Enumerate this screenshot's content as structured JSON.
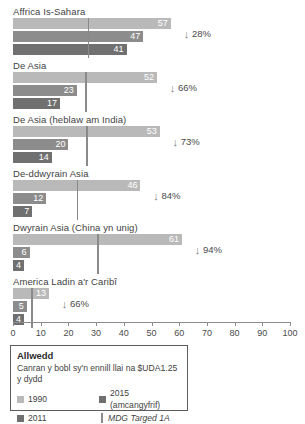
{
  "chart_data": {
    "type": "bar",
    "title": "",
    "xlabel": "",
    "ylabel": "",
    "xlim": [
      0,
      100
    ],
    "grid": false,
    "orientation": "horizontal",
    "legend_position": "bottom-left",
    "tick_labels": [
      "0",
      "10",
      "20",
      "30",
      "40",
      "50",
      "60",
      "70",
      "80",
      "90",
      "100"
    ],
    "ticks": [
      0,
      10,
      20,
      30,
      40,
      50,
      60,
      70,
      80,
      90,
      100
    ],
    "series": [
      {
        "name": "1990",
        "color": "#b9b9b9",
        "values": [
          57,
          52,
          53,
          46,
          61,
          13
        ]
      },
      {
        "name": "2015 (amcangyfrif)",
        "color": "#8c8c8c",
        "values": [
          47,
          23,
          20,
          12,
          6,
          5
        ]
      },
      {
        "name": "2011",
        "color": "#707070",
        "values": [
          41,
          17,
          14,
          7,
          4,
          4
        ]
      }
    ],
    "categories": [
      "Affrica Is-Sahara",
      "De Asia",
      "De Asia (heblaw am India)",
      "De-ddwyrain Asia",
      "Dwyrain Asia (China yn unig)",
      "America Ladin a'r Caribî"
    ],
    "target_values": [
      27,
      26,
      26.5,
      23,
      30.5,
      6.5
    ],
    "annotations": [
      "28%",
      "66%",
      "73%",
      "84%",
      "94%",
      "66%"
    ]
  },
  "groups": [
    {
      "label": "Affrica Is-Sahara",
      "bars": [
        {
          "series": "1990",
          "value": 57,
          "label": "57",
          "class": "y1990"
        },
        {
          "series": "2015",
          "value": 47,
          "label": "47",
          "class": "y2015"
        },
        {
          "series": "2011",
          "value": 41,
          "label": "41",
          "class": "y2011"
        }
      ],
      "target": 27,
      "delta": "28%"
    },
    {
      "label": "De Asia",
      "bars": [
        {
          "series": "1990",
          "value": 52,
          "label": "52",
          "class": "y1990"
        },
        {
          "series": "2015",
          "value": 23,
          "label": "23",
          "class": "y2015"
        },
        {
          "series": "2011",
          "value": 17,
          "label": "17",
          "class": "y2011"
        }
      ],
      "target": 26,
      "delta": "66%"
    },
    {
      "label": "De Asia (heblaw am India)",
      "bars": [
        {
          "series": "1990",
          "value": 53,
          "label": "53",
          "class": "y1990"
        },
        {
          "series": "2015",
          "value": 20,
          "label": "20",
          "class": "y2015"
        },
        {
          "series": "2011",
          "value": 14,
          "label": "14",
          "class": "y2011"
        }
      ],
      "target": 26.5,
      "delta": "73%"
    },
    {
      "label": "De-ddwyrain Asia",
      "bars": [
        {
          "series": "1990",
          "value": 46,
          "label": "46",
          "class": "y1990"
        },
        {
          "series": "2015",
          "value": 12,
          "label": "12",
          "class": "y2015"
        },
        {
          "series": "2011",
          "value": 7,
          "label": "7",
          "class": "y2011"
        }
      ],
      "target": 23,
      "delta": "84%"
    },
    {
      "label": "Dwyrain Asia (China yn unig)",
      "bars": [
        {
          "series": "1990",
          "value": 61,
          "label": "61",
          "class": "y1990"
        },
        {
          "series": "2015",
          "value": 6,
          "label": "6",
          "class": "y2015"
        },
        {
          "series": "2011",
          "value": 4,
          "label": "4",
          "class": "y2011"
        }
      ],
      "target": 30.5,
      "delta": "94%"
    },
    {
      "label": "America Ladin a'r Caribî",
      "bars": [
        {
          "series": "1990",
          "value": 13,
          "label": "13",
          "class": "y1990"
        },
        {
          "series": "2015",
          "value": 5,
          "label": "5",
          "class": "y2015"
        },
        {
          "series": "2011",
          "value": 4,
          "label": "4",
          "class": "y2011"
        }
      ],
      "target": 6.5,
      "delta": "66%"
    }
  ],
  "axis": {
    "min": 0,
    "max": 100,
    "ticks": [
      "0",
      "10",
      "20",
      "30",
      "40",
      "50",
      "60",
      "70",
      "80",
      "90",
      "100"
    ]
  },
  "legend": {
    "title": "Allwedd",
    "subtitle": "Canran y bobl sy'n ennill llai na $UDA1.25 y dydd",
    "items": [
      {
        "label": "1990",
        "swatch": "sw-1990",
        "kind": "swatch"
      },
      {
        "label": "2015 (amcangyfrif)",
        "swatch": "sw-2015",
        "kind": "swatch"
      },
      {
        "label": "2011",
        "swatch": "sw-2011",
        "kind": "swatch"
      },
      {
        "label": "MDG Targed 1A",
        "swatch": "sw-line",
        "kind": "line"
      }
    ]
  },
  "icons": {
    "down_arrow": "↓"
  }
}
